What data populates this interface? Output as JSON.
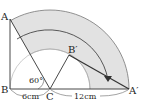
{
  "diagram": {
    "labels": {
      "A": "A",
      "B": "B",
      "C": "C",
      "B_prime": "B′",
      "A_prime": "A′",
      "angle": "60°",
      "bc_length": "6cm",
      "ca_length": "12cm"
    },
    "colors": {
      "shade": "#e2e2e2",
      "line": "#333333",
      "thin": "#999999"
    }
  }
}
